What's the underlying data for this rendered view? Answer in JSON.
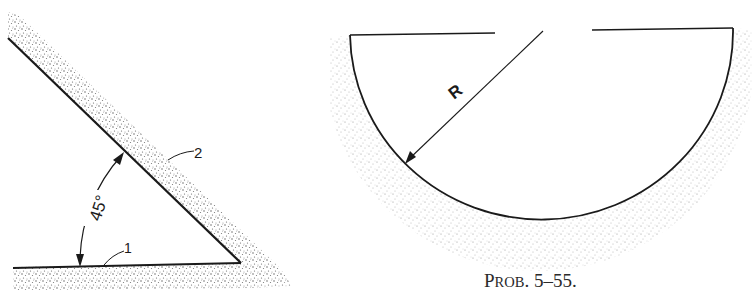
{
  "figure_left": {
    "angle_label": "45°",
    "surface_1_label": "1",
    "surface_2_label": "2"
  },
  "figure_right": {
    "radius_label": "R"
  },
  "caption": {
    "prefix": "P",
    "smallcaps": "ROB",
    "number": ". 5–55."
  },
  "colors": {
    "line": "#1a1a1a",
    "stipple": "#8a8a8a",
    "background": "#ffffff"
  }
}
